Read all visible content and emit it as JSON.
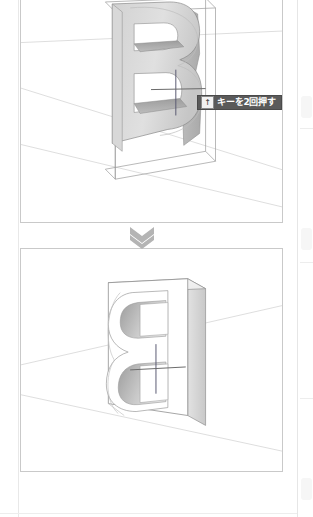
{
  "document": {
    "kind": "instructional-figure-page",
    "panel_count": 2
  },
  "panels": [
    {
      "id": "before",
      "caption": "",
      "model": {
        "object": "letter-B-extrusion",
        "state": "outline-extruded",
        "letter": "B"
      }
    },
    {
      "id": "after",
      "caption": "",
      "model": {
        "object": "letter-B-extrusion",
        "state": "solid-block-subtracted",
        "letter": "B"
      }
    }
  ],
  "tooltip": {
    "key_glyph": "↑",
    "key_name": "up-arrow-key",
    "text": "キーを2回押す",
    "background": "#5a5a5a",
    "text_color": "#ffffff"
  },
  "separator": {
    "icon": "double-chevron-down",
    "color": "#b4b4b4",
    "count": 2
  },
  "colors": {
    "panel_border": "#c9c9c9",
    "page_background": "#ffffff",
    "model_face_light": "#e3e3e3",
    "model_face_mid": "#cfcfcf",
    "model_face_dark": "#a8a8a8",
    "wireframe": "#8c8c8c",
    "ground_line": "#dcdcdc",
    "inference_line": "#5a5a72"
  }
}
